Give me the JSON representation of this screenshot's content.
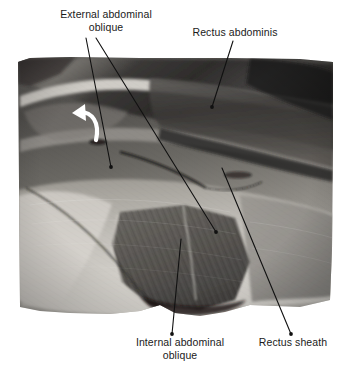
{
  "figure": {
    "type": "anatomical-dissection-photograph",
    "rendering": "grayscale photograph",
    "background_color": "#ffffff",
    "label_color": "#1a1a1a",
    "leader_line_color": "#111111",
    "arrow_color": "#ffffff"
  },
  "labels": {
    "external_abdominal_oblique": "External abdominal\noblique",
    "rectus_abdominis": "Rectus abdominis",
    "internal_abdominal_oblique": "Internal abdominal\noblique",
    "rectus_sheath": "Rectus sheath"
  },
  "photo": {
    "bounds": {
      "left": 18,
      "top": 57,
      "right": 333,
      "bottom": 315
    },
    "tone_range": {
      "darkest": "#141414",
      "lightest": "#e8e6e2"
    }
  },
  "annotations": {
    "leader_lines": [
      {
        "name": "external-abdominal-oblique-leader-1",
        "x1": 86,
        "y1": 38,
        "x2": 111,
        "y2": 167
      },
      {
        "name": "external-abdominal-oblique-leader-2",
        "x1": 96,
        "y1": 38,
        "x2": 216,
        "y2": 232
      },
      {
        "name": "rectus-abdominis-leader",
        "x1": 233,
        "y1": 41,
        "x2": 212,
        "y2": 107
      },
      {
        "name": "internal-abdominal-oblique-leader",
        "x1": 181,
        "y1": 239,
        "x2": 172,
        "y2": 334
      },
      {
        "name": "rectus-sheath-leader",
        "x1": 222,
        "y1": 168,
        "x2": 291,
        "y2": 334
      }
    ],
    "curved_arrow": {
      "name": "reflection-direction-arrow",
      "color": "#ffffff",
      "description": "white curved arrow indicating reflected muscle flap direction"
    }
  }
}
